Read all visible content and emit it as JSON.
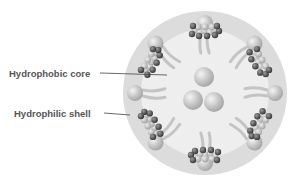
{
  "labels": {
    "core": "Hydrophobic core",
    "shell": "Hydrophilic shell"
  },
  "colors": {
    "outer": "#dcdcdc",
    "inner": "#efefef",
    "head": "#bdbdbd",
    "tail": "#c4c4c4",
    "drug_dark": "#555555",
    "drug_light": "#b8b8b8",
    "line": "#444444"
  },
  "diagram": {
    "type": "micelle-cross-section",
    "amphiphile_count": 8,
    "drug_cluster_count": 6,
    "core_particle_count": 3
  }
}
